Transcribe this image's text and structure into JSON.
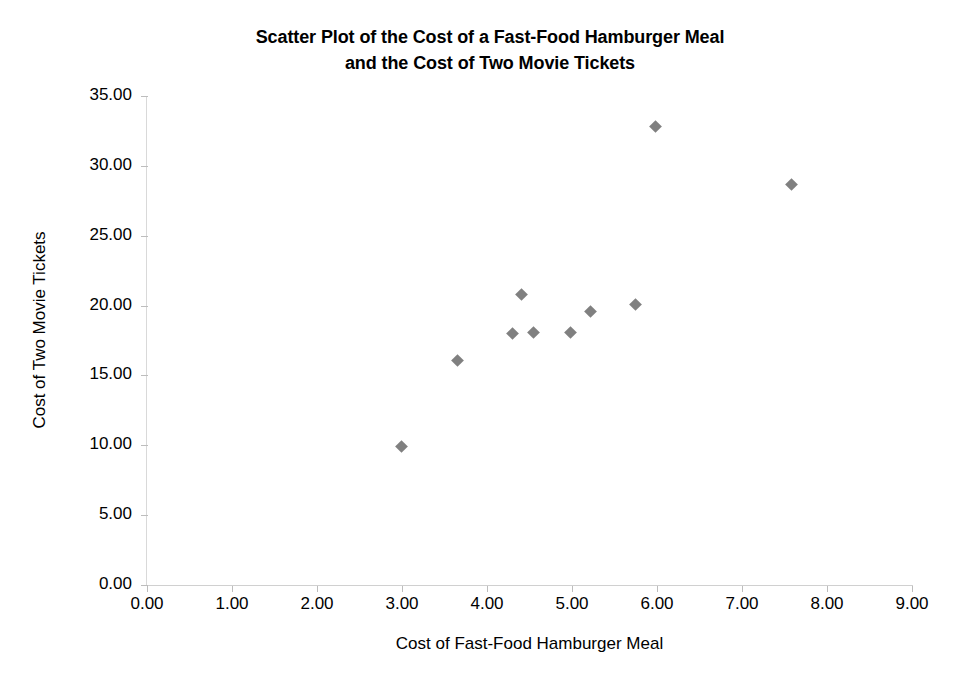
{
  "chart_data": {
    "type": "scatter",
    "title": "Scatter Plot of the Cost of a Fast-Food Hamburger Meal and the Cost of Two Movie Tickets",
    "title_lines": [
      "Scatter Plot of the Cost of a Fast-Food Hamburger Meal",
      "and the Cost of Two Movie Tickets"
    ],
    "xlabel": "Cost of Fast-Food Hamburger Meal",
    "ylabel": "Cost of Two Movie Tickets",
    "xlim": [
      0,
      9
    ],
    "ylim": [
      0,
      35
    ],
    "xticks": [
      0,
      1,
      2,
      3,
      4,
      5,
      6,
      7,
      8,
      9
    ],
    "yticks": [
      0,
      5,
      10,
      15,
      20,
      25,
      30,
      35
    ],
    "xtick_labels": [
      "0.00",
      "1.00",
      "2.00",
      "3.00",
      "4.00",
      "5.00",
      "6.00",
      "7.00",
      "8.00",
      "9.00"
    ],
    "ytick_labels": [
      "0.00",
      "5.00",
      "10.00",
      "15.00",
      "20.00",
      "25.00",
      "30.00",
      "35.00"
    ],
    "grid": false,
    "legend": null,
    "marker_shape": "diamond",
    "marker_color": "#808080",
    "series": [
      {
        "name": "Cost pairs",
        "points": [
          {
            "x": 2.99,
            "y": 9.9
          },
          {
            "x": 3.65,
            "y": 16.05
          },
          {
            "x": 4.3,
            "y": 18.0
          },
          {
            "x": 4.4,
            "y": 20.8
          },
          {
            "x": 4.55,
            "y": 18.1
          },
          {
            "x": 4.98,
            "y": 18.1
          },
          {
            "x": 5.22,
            "y": 19.6
          },
          {
            "x": 5.75,
            "y": 20.1
          },
          {
            "x": 5.98,
            "y": 32.85
          },
          {
            "x": 7.58,
            "y": 28.65
          }
        ]
      }
    ]
  }
}
